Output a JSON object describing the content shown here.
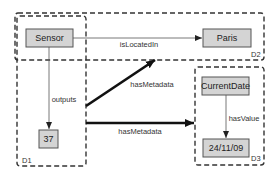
{
  "diagram": {
    "groups": [
      {
        "id": "D1",
        "label": "D1"
      },
      {
        "id": "D2",
        "label": "D2"
      },
      {
        "id": "D3",
        "label": "D3"
      }
    ],
    "nodes": {
      "sensor": "Sensor",
      "paris": "Paris",
      "value37": "37",
      "currentdate": "CurrentDate",
      "date": "24/11/09"
    },
    "edges": [
      {
        "from": "Sensor",
        "to": "Paris",
        "label": "isLocatedIn",
        "style": "thin"
      },
      {
        "from": "Sensor",
        "to": "37",
        "label": "outputs",
        "style": "thin"
      },
      {
        "from": "D1",
        "to": "D2",
        "label": "hasMetadata",
        "style": "thick"
      },
      {
        "from": "D1",
        "to": "D3",
        "label": "hasMetadata",
        "style": "thick"
      },
      {
        "from": "CurrentDate",
        "to": "24/11/09",
        "label": "hasValue",
        "style": "thin"
      }
    ],
    "colors": {
      "node_fill": "#d4d4d4",
      "node_stroke": "#555555",
      "group_stroke": "#333333",
      "thick_edge": "#111111"
    }
  }
}
